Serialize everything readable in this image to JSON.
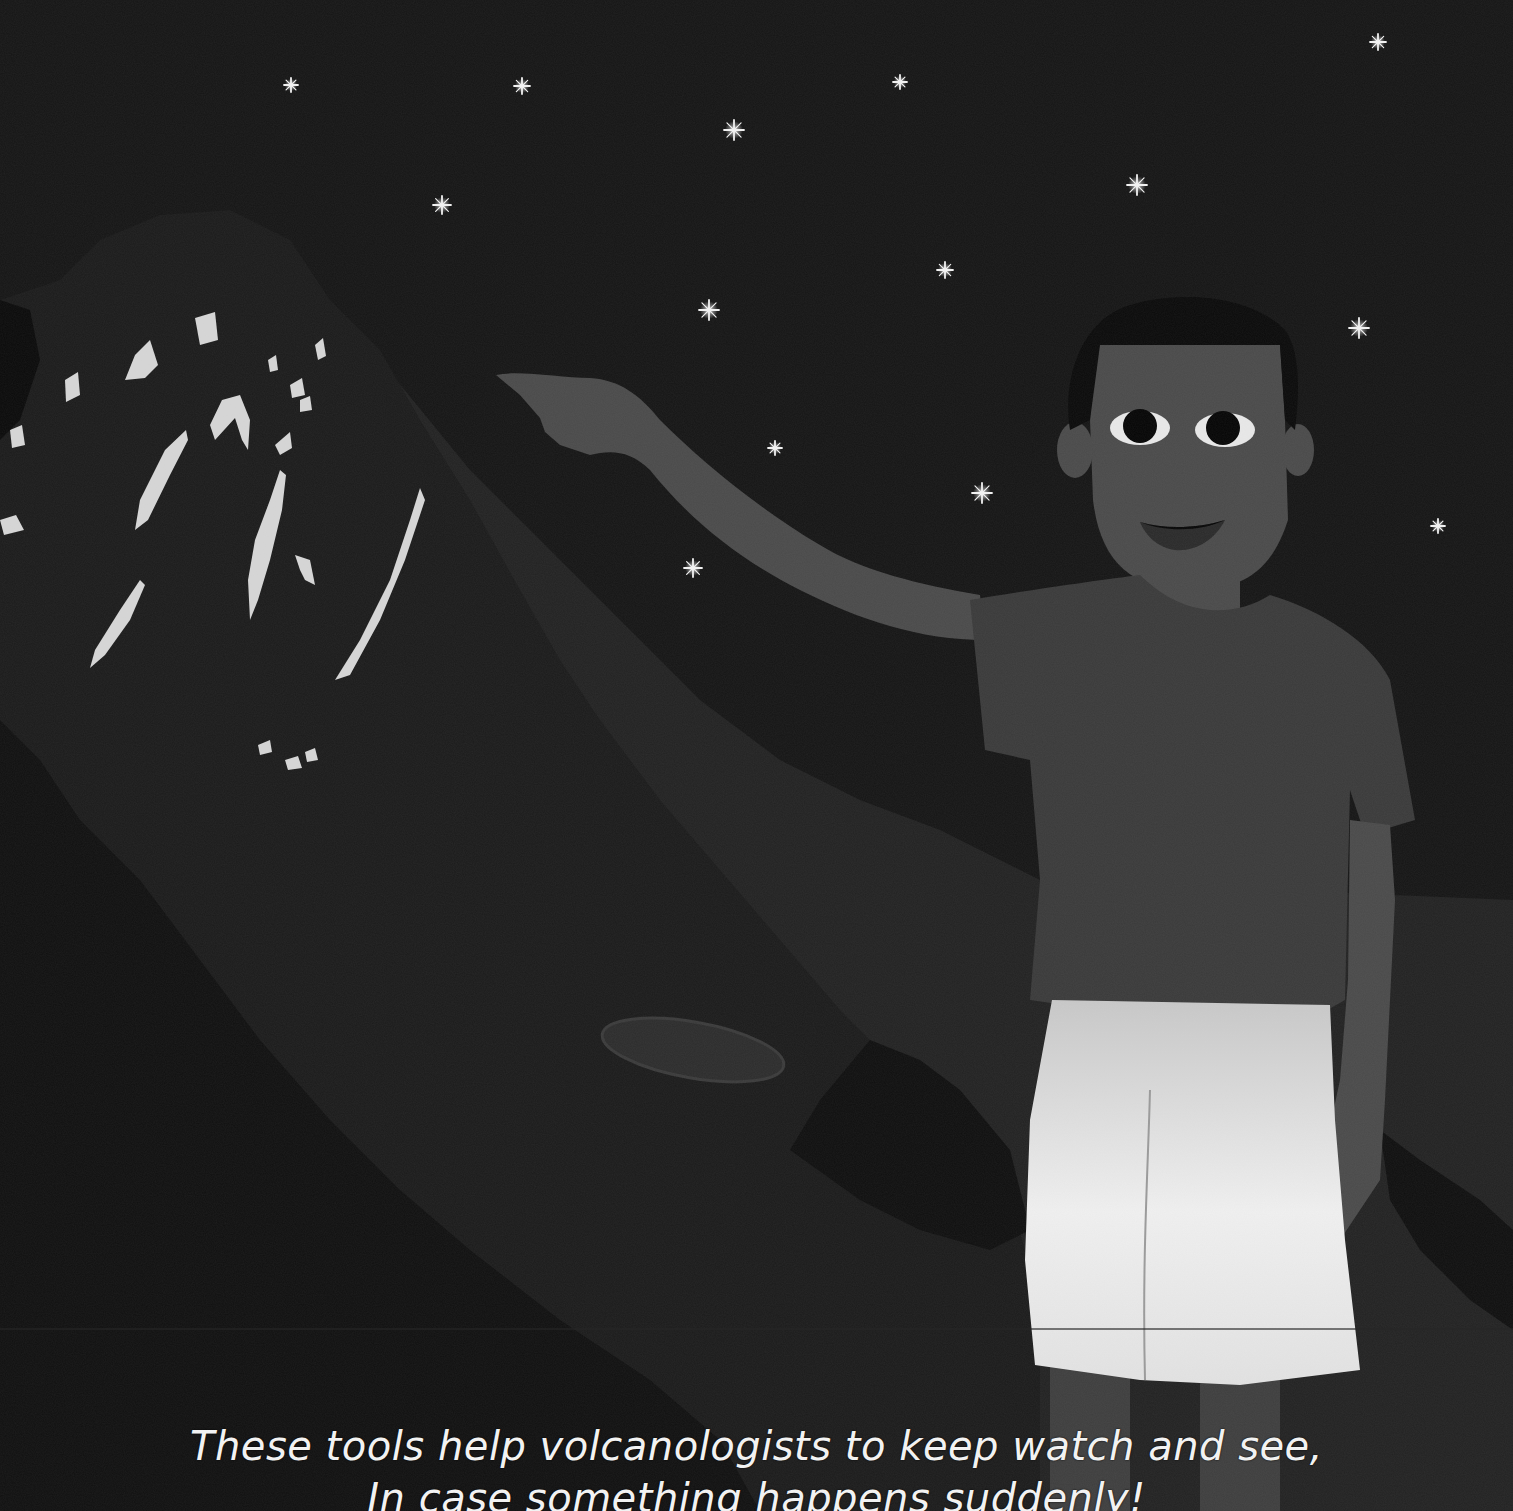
{
  "page": {
    "background": "#141414",
    "sky_color": "#151515"
  },
  "scene": {
    "description": "Night scene: a boy pointing toward a glowing volcano under a starry sky",
    "stars": [
      {
        "x": 291,
        "y": 85,
        "r": 7
      },
      {
        "x": 522,
        "y": 86,
        "r": 8
      },
      {
        "x": 900,
        "y": 82,
        "r": 7
      },
      {
        "x": 734,
        "y": 130,
        "r": 10
      },
      {
        "x": 1378,
        "y": 42,
        "r": 8
      },
      {
        "x": 442,
        "y": 205,
        "r": 9
      },
      {
        "x": 1137,
        "y": 185,
        "r": 10
      },
      {
        "x": 945,
        "y": 270,
        "r": 8
      },
      {
        "x": 709,
        "y": 310,
        "r": 10
      },
      {
        "x": 1359,
        "y": 328,
        "r": 10
      },
      {
        "x": 775,
        "y": 448,
        "r": 7
      },
      {
        "x": 982,
        "y": 493,
        "r": 10
      },
      {
        "x": 1438,
        "y": 526,
        "r": 7
      },
      {
        "x": 693,
        "y": 568,
        "r": 9
      }
    ],
    "colors": {
      "volcano": "#1c1c1c",
      "volcano_dark": "#121212",
      "mountain_ridge": "#252525",
      "lava_glow": "#d8d8d8",
      "skin": "#4a4a4a",
      "hair": "#0a0a0a",
      "shirt": "#3a3a3a",
      "shorts": "#e6e6e6",
      "star": "#f4f4f4"
    }
  },
  "caption": {
    "line1": "These tools help volcanologists to keep watch and see,",
    "line2": "In case something happens suddenly!"
  }
}
